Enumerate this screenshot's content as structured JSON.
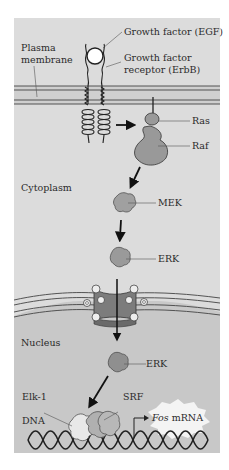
{
  "figure": {
    "colors": {
      "cytoplasm": "#dadada",
      "nucleus": "#c6c6c6",
      "membrane_band": "#c8c8c8",
      "protein": "#9a9a9a",
      "protein_dark": "#8a8a8a",
      "pore": "#7a7a7a",
      "outline": "#333333",
      "text": "#2a2a2a",
      "background": "#ffffff"
    },
    "labels": {
      "growth_factor": "Growth factor (EGF)",
      "receptor_line1": "Growth factor",
      "receptor_line2": "receptor (ErbB)",
      "plasma_line1": "Plasma",
      "plasma_line2": "membrane",
      "ras": "Ras",
      "raf": "Raf",
      "cytoplasm": "Cytoplasm",
      "mek": "MEK",
      "erk_cyto": "ERK",
      "nucleus": "Nucleus",
      "erk_nuc": "ERK",
      "elk1": "Elk-1",
      "srf": "SRF",
      "dna": "DNA",
      "fos_italic": "Fos",
      "fos_rest": " mRNA"
    }
  }
}
